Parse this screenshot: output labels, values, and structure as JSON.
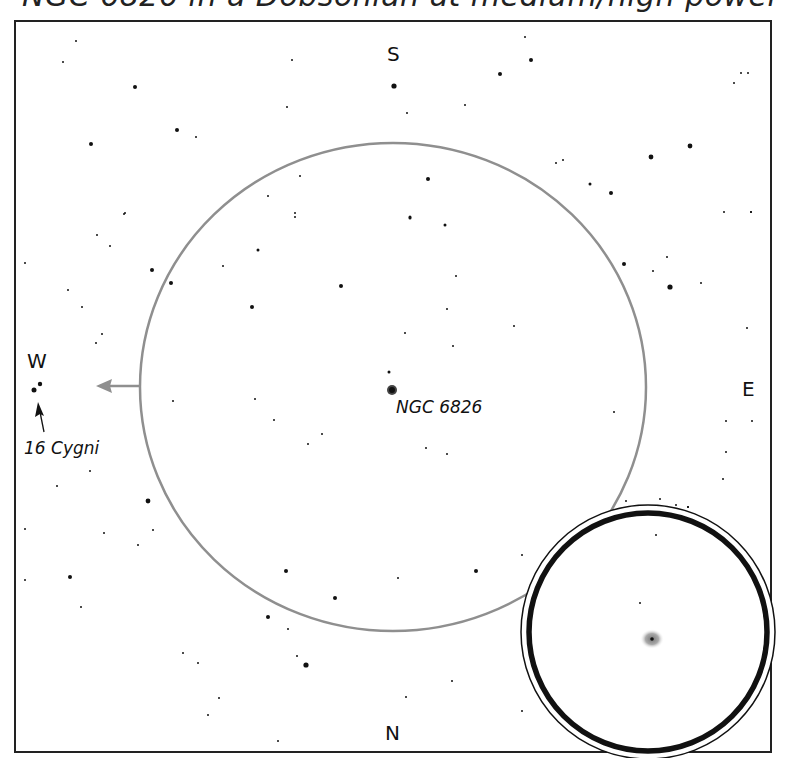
{
  "title": "NGC 6826 in a Dobsonian at medium/high power",
  "compass": {
    "top": "S",
    "bottom": "N",
    "left": "W",
    "right": "E"
  },
  "labels": {
    "target": "NGC 6826",
    "guide_star": "16 Cygni"
  },
  "field_circle": {
    "cx": 393,
    "cy": 387,
    "rx": 253,
    "ry": 244,
    "color": "#8f8f8f"
  },
  "eyepiece_inset": {
    "cx": 648,
    "cy": 632,
    "r_outer": 127,
    "r_ring": 121
  },
  "colors": {
    "frame": "#222222",
    "stars": "#111111",
    "circle": "#8f8f8f",
    "nebula": "#9a9a9a"
  }
}
